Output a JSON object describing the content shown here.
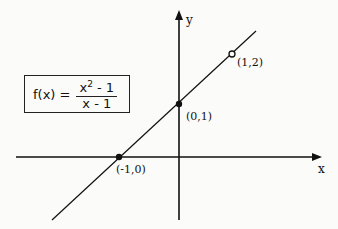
{
  "formula": {
    "lhs": "f(x) =",
    "numerator_base": "x",
    "numerator_exp": "2",
    "numerator_rest": " - 1",
    "denominator": "x - 1"
  },
  "axes": {
    "x_label": "x",
    "y_label": "y"
  },
  "points": [
    {
      "label": "(1,2)",
      "style": "open"
    },
    {
      "label": "(0,1)",
      "style": "filled"
    },
    {
      "label": "(-1,0)",
      "style": "filled"
    }
  ],
  "colors": {
    "ink": "#111111",
    "background": "#fbfbfa"
  }
}
